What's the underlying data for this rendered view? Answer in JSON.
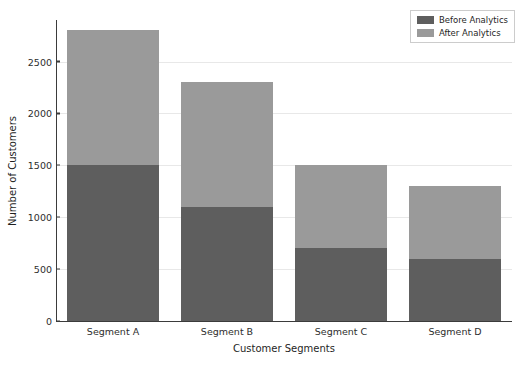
{
  "chart_data": {
    "type": "bar",
    "subtype": "stacked",
    "title": "",
    "xlabel": "Customer Segments",
    "ylabel": "Number of Customers",
    "categories": [
      "Segment A",
      "Segment B",
      "Segment C",
      "Segment D"
    ],
    "series": [
      {
        "name": "Before Analytics",
        "values": [
          1500,
          1100,
          700,
          600
        ],
        "color": "#5e5e5e"
      },
      {
        "name": "After Analytics",
        "values": [
          1300,
          1200,
          800,
          700
        ],
        "color": "#9a9a9a"
      }
    ],
    "totals": [
      2800,
      2300,
      1500,
      1300
    ],
    "ylim": [
      0,
      2900
    ],
    "yticks": [
      0,
      500,
      1000,
      1500,
      2000,
      2500
    ],
    "ytick_labels": [
      "0",
      "500",
      "1000",
      "1500",
      "2000",
      "2500"
    ],
    "grid": true,
    "grid_axis": "y",
    "legend_position": "upper right",
    "background": "#ffffff"
  },
  "legend": {
    "entries": [
      {
        "label": "Before Analytics"
      },
      {
        "label": "After Analytics"
      }
    ]
  }
}
